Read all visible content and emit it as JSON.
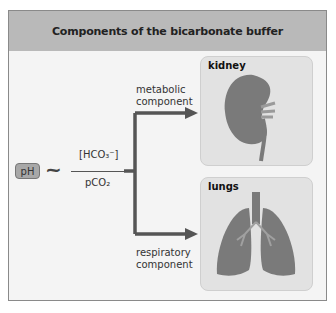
{
  "header": {
    "title": "Components of the bicarbonate buffer"
  },
  "equation": {
    "lhs": "pH",
    "relation": "~",
    "numerator": "[HCO₃⁻]",
    "denominator": "pCO₂"
  },
  "branches": [
    {
      "label_line1": "metabolic",
      "label_line2": "component",
      "target": "kidney"
    },
    {
      "label_line1": "respiratory",
      "label_line2": "component",
      "target": "lungs"
    }
  ],
  "panels": {
    "kidney": {
      "title": "kidney"
    },
    "lungs": {
      "title": "lungs"
    }
  },
  "colors": {
    "header": "#b9b9b9",
    "arrow": "#555555",
    "organ": "#7a7a7a",
    "panel": "#e2e2e2"
  }
}
